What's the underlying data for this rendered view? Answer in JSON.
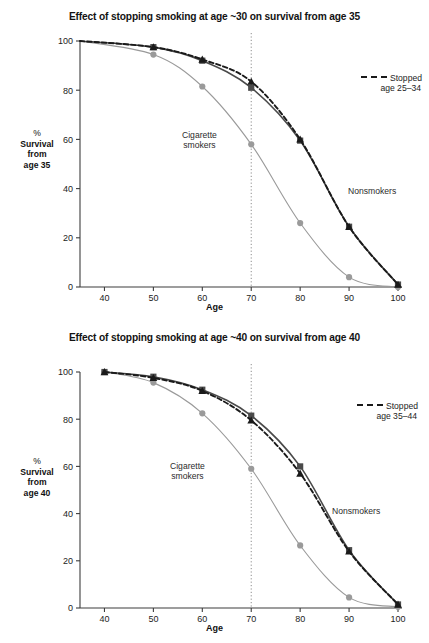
{
  "figure": {
    "axis_label_x": "Age",
    "colors": {
      "nonsmokers": "#4a4a4a",
      "stopped": "#1a1a1a",
      "smokers": "#9a9a9a",
      "axis": "#3d3d3d",
      "reference_line": "#8c8c8c"
    }
  },
  "panels": [
    {
      "id": "top",
      "title": "Effect of stopping smoking at age ~30 on survival from age 35",
      "ylabel_lines": [
        "%",
        "Survival",
        "from",
        "age 35"
      ],
      "annotations": {
        "smokers": [
          "Cigarette",
          "smokers"
        ],
        "nonsmokers": "Nonsmokers",
        "legend": [
          "Stopped",
          "age 25–34"
        ]
      },
      "chart_data": {
        "type": "line",
        "title": "Effect of stopping smoking at age ~30 on survival from age 35",
        "xlabel": "Age",
        "ylabel": "% Survival from age 35",
        "xlim": [
          35,
          100
        ],
        "ylim": [
          0,
          100
        ],
        "xticks": [
          40,
          50,
          60,
          70,
          80,
          90,
          100
        ],
        "yticks": [
          0,
          20,
          40,
          60,
          80,
          100
        ],
        "grid": false,
        "legend_position": "upper-right",
        "reference_line_x": 70,
        "series": [
          {
            "name": "Nonsmokers",
            "marker": "square",
            "linestyle": "solid",
            "color": "#4a4a4a",
            "x": [
              35,
              50,
              60,
              70,
              80,
              90,
              100
            ],
            "values": [
              100,
              97.5,
              92,
              81,
              59.5,
              24.5,
              1
            ]
          },
          {
            "name": "Stopped age 25–34",
            "marker": "triangle",
            "linestyle": "dashed",
            "color": "#1a1a1a",
            "x": [
              35,
              50,
              60,
              70,
              80,
              90,
              100
            ],
            "values": [
              100,
              97.5,
              92.5,
              83.5,
              60,
              24.5,
              1
            ]
          },
          {
            "name": "Cigarette smokers",
            "marker": "circle",
            "linestyle": "solid",
            "color": "#9a9a9a",
            "x": [
              35,
              50,
              60,
              70,
              80,
              90,
              100
            ],
            "values": [
              100,
              94.5,
              81.5,
              58,
              26,
              4,
              0
            ]
          }
        ]
      }
    },
    {
      "id": "bottom",
      "title": "Effect of stopping smoking at age ~40 on survival from age 40",
      "ylabel_lines": [
        "%",
        "Survival",
        "from",
        "age 40"
      ],
      "annotations": {
        "smokers": [
          "Cigarette",
          "smokers"
        ],
        "nonsmokers": "Nonsmokers",
        "legend": [
          "Stopped",
          "age 35–44"
        ]
      },
      "chart_data": {
        "type": "line",
        "title": "Effect of stopping smoking at age ~40 on survival from age 40",
        "xlabel": "Age",
        "ylabel": "% Survival from age 40",
        "xlim": [
          35,
          100
        ],
        "ylim": [
          0,
          100
        ],
        "xticks": [
          40,
          50,
          60,
          70,
          80,
          90,
          100
        ],
        "yticks": [
          0,
          20,
          40,
          60,
          80,
          100
        ],
        "grid": false,
        "legend_position": "upper-right",
        "reference_line_x": 70,
        "series": [
          {
            "name": "Nonsmokers",
            "marker": "square",
            "linestyle": "solid",
            "color": "#4a4a4a",
            "x": [
              40,
              50,
              60,
              70,
              80,
              90,
              100
            ],
            "values": [
              100,
              98,
              92.5,
              81.5,
              60,
              24.5,
              1.5
            ]
          },
          {
            "name": "Stopped age 35–44",
            "marker": "triangle",
            "linestyle": "dashed",
            "color": "#1a1a1a",
            "x": [
              40,
              50,
              60,
              70,
              80,
              90,
              100
            ],
            "values": [
              100,
              97.5,
              92,
              79.5,
              57,
              24,
              1.5
            ]
          },
          {
            "name": "Cigarette smokers",
            "marker": "circle",
            "linestyle": "solid",
            "color": "#9a9a9a",
            "x": [
              40,
              50,
              60,
              70,
              80,
              90,
              100
            ],
            "values": [
              100,
              95.5,
              82.5,
              59,
              26.5,
              4.5,
              0.5
            ]
          }
        ]
      }
    }
  ]
}
